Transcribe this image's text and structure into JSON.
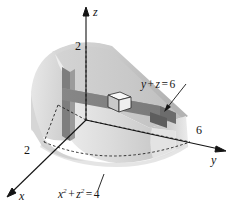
{
  "figure": {
    "type": "math-3d-solid-diagram",
    "background_color": "#ffffff",
    "ink_color": "#141414"
  },
  "axes": {
    "z": {
      "label": "z",
      "tick_label": "2"
    },
    "y": {
      "label": "y",
      "tick_label": "6"
    },
    "x": {
      "label": "x",
      "tick_label": "2"
    }
  },
  "annotations": {
    "plane": {
      "text_y": "y",
      "plus": "+",
      "text_z": "z",
      "equals": "=",
      "value": "6",
      "full": "y + z = 6"
    },
    "cylinder": {
      "x_base": "x",
      "x_exp": "2",
      "plus": "+",
      "z_base": "z",
      "z_exp": "2",
      "equals": "=",
      "value": "4",
      "full": "x² + z² = 4"
    }
  },
  "solid": {
    "surface_color_light": "#e4e4e4",
    "surface_color_mid": "#c9c9c9",
    "surface_color_dark": "#a8a8a8",
    "slab_color": "#8a8a8a",
    "slab_color_dark": "#6e6e6e",
    "cube_color": "#f4f4f4"
  },
  "elements": {
    "volume_element_cube": "small cube on slab",
    "cross_section_slab": "horizontal dark slab",
    "vertical_post": "vertical dark slab at left"
  }
}
